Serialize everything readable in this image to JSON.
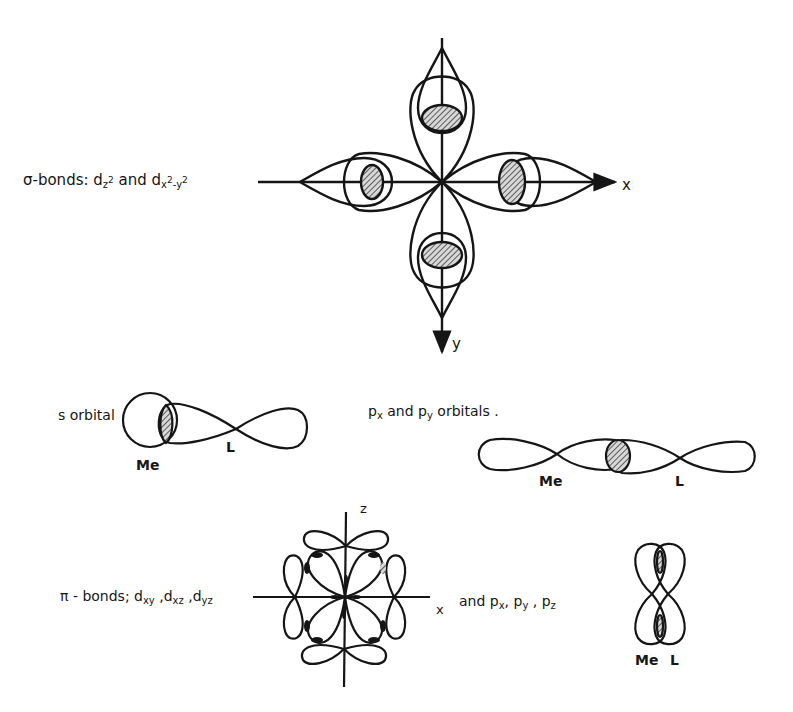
{
  "figure": {
    "sigma_label": {
      "prefix": "σ-bonds: d",
      "sub1": "z",
      "sup1": "2",
      "mid": " and d",
      "sub2": "x",
      "sup2": "2",
      "sub2b": "-y",
      "sup2b": "2"
    },
    "sigma_axes": {
      "x": "x",
      "y": "y"
    },
    "s_orbital": {
      "label": "s orbital",
      "metal": "Me",
      "ligand": "L"
    },
    "p_orbitals": {
      "label_p": "p",
      "label_sub_x": "x",
      "label_mid": " and p",
      "label_sub_y": "y",
      "label_tail": " orbitals .",
      "metal": "Me",
      "ligand": "L"
    },
    "pi_label": {
      "prefix": "π - bonds; d",
      "sub1": "xy",
      "sep1": " ,d",
      "sub2": "xz",
      "sep2": " ,d",
      "sub3": "yz"
    },
    "pi_axes": {
      "x": "x",
      "z": "z"
    },
    "pi_p_label": {
      "prefix": "and  p",
      "sub1": "x",
      "sep1": ", p",
      "sub2": "y",
      "sep2": " , p",
      "sub3": "z"
    },
    "pi_p_figure": {
      "metal": "Me",
      "ligand": "L"
    },
    "colors": {
      "ink": "#151515",
      "paper": "#ffffff",
      "hatch": "#8a8a8a"
    }
  }
}
